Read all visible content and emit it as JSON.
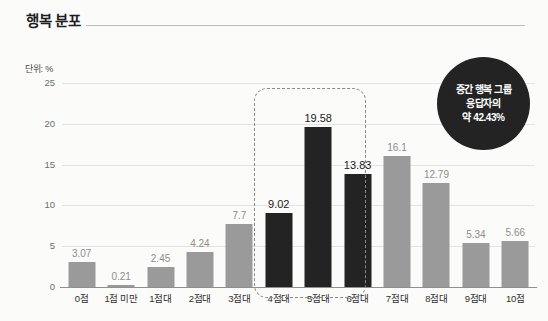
{
  "header": {
    "title": "행복 분포",
    "rule": "horizontal-rule"
  },
  "unit_note": "단위: %",
  "callout": {
    "line1": "중간 행복 그룹",
    "line2": "응답자의",
    "line3": "약 42.43%"
  },
  "colors": {
    "bar_normal": "#9a9a9a",
    "bar_highlight": "#232323",
    "badge_bg": "#232323",
    "gridline": "#e3e3e1",
    "axis": "#8f8f8f",
    "background": "#fbfbfa"
  },
  "chart_data": {
    "type": "bar",
    "title": "행복 분포",
    "subtitle": "",
    "xlabel": "",
    "ylabel": "단위: %",
    "ylim": [
      0,
      25
    ],
    "yticks": [
      0,
      5,
      10,
      15,
      20,
      25
    ],
    "ytick_labels": [
      "0",
      "5",
      "10",
      "15",
      "20",
      "25"
    ],
    "grid": true,
    "legend": null,
    "categories": [
      "0점",
      "1점 미만",
      "1점대",
      "2점대",
      "3점대",
      "4점대",
      "5점대",
      "6점대",
      "7점대",
      "8점대",
      "9점대",
      "10점"
    ],
    "values": [
      3.07,
      0.21,
      2.45,
      4.24,
      7.7,
      9.02,
      19.58,
      13.83,
      16.1,
      12.79,
      5.34,
      5.66
    ],
    "value_labels": [
      "3.07",
      "0.21",
      "2.45",
      "4.24",
      "7.7",
      "9.02",
      "19.58",
      "13.83",
      "16.1",
      "12.79",
      "5.34",
      "5.66"
    ],
    "highlighted": [
      false,
      false,
      false,
      false,
      false,
      true,
      true,
      true,
      false,
      false,
      false,
      false
    ],
    "annotations": [
      {
        "type": "dashed-group-box",
        "covers": [
          "4점대",
          "5점대",
          "6점대"
        ]
      },
      {
        "type": "callout-circle",
        "text": "중간 행복 그룹 응답자의 약 42.43%",
        "value": 42.43
      }
    ]
  }
}
